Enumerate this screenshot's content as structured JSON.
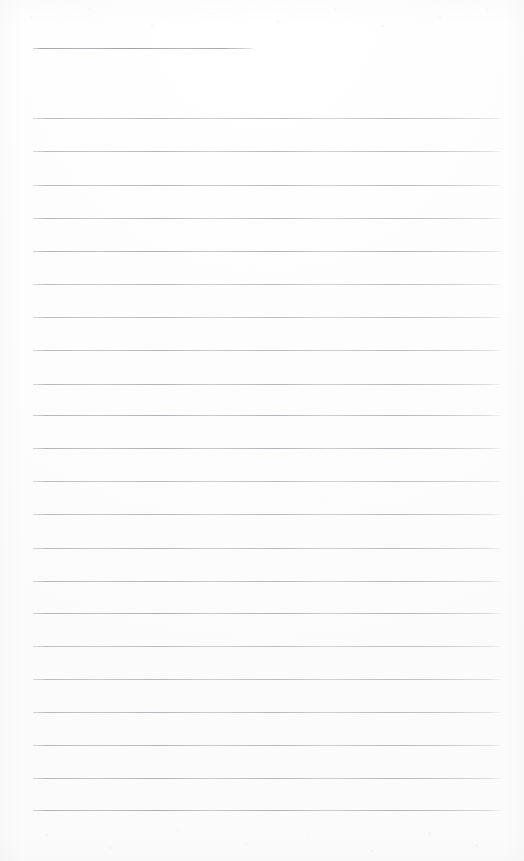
{
  "document": {
    "kind": "scanned-lined-paper",
    "title": "Blank Ruled Notepad Page",
    "page_width": 524,
    "page_height": 861,
    "background_color": "#fdfdfd",
    "content_text": "",
    "handwriting_present": "no",
    "printed_text_present": "no"
  },
  "ruling": {
    "line_color": "#b2b4b7",
    "line_thickness_px": 1,
    "left_margin_px": 33,
    "right_margin_px": 500,
    "line_length_px": 467,
    "line_spacing_px": 33.2,
    "first_full_line_y": 118,
    "last_full_line_y": 810,
    "full_line_count": 22,
    "top_blank_margin_px": 48,
    "bottom_blank_margin_px": 51
  },
  "header_rule": {
    "label": "header-blank-rule",
    "y": 48,
    "x_start": 33,
    "x_end": 253,
    "length_px": 220,
    "color": "#a0a2a8"
  },
  "full_rules": [
    {
      "index": 1,
      "y": 118
    },
    {
      "index": 2,
      "y": 151
    },
    {
      "index": 3,
      "y": 185
    },
    {
      "index": 4,
      "y": 218
    },
    {
      "index": 5,
      "y": 251
    },
    {
      "index": 6,
      "y": 284
    },
    {
      "index": 7,
      "y": 317
    },
    {
      "index": 8,
      "y": 350
    },
    {
      "index": 9,
      "y": 384
    },
    {
      "index": 10,
      "y": 415
    },
    {
      "index": 11,
      "y": 448
    },
    {
      "index": 12,
      "y": 481
    },
    {
      "index": 13,
      "y": 514
    },
    {
      "index": 14,
      "y": 548
    },
    {
      "index": 15,
      "y": 581
    },
    {
      "index": 16,
      "y": 613
    },
    {
      "index": 17,
      "y": 646
    },
    {
      "index": 18,
      "y": 679
    },
    {
      "index": 19,
      "y": 712
    },
    {
      "index": 20,
      "y": 745
    },
    {
      "index": 21,
      "y": 778
    },
    {
      "index": 22,
      "y": 810
    }
  ]
}
